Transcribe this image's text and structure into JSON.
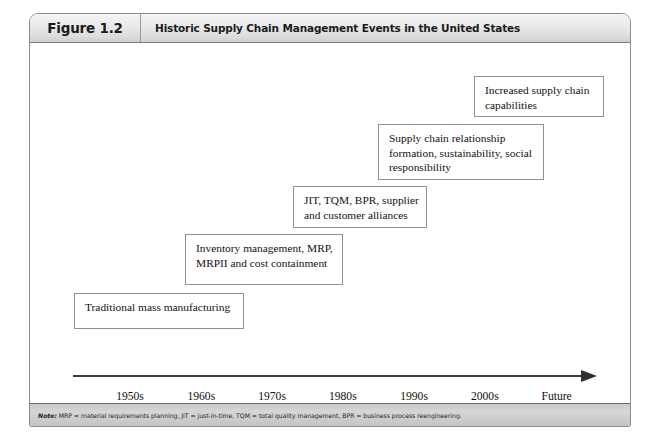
{
  "figure": {
    "number_label": "Figure 1.2",
    "title": "Historic Supply Chain Management Events in the United States",
    "note_prefix": "Note:",
    "note_text": " MRP = material requirements planning, JIT = just-in-time, TQM = total quality management, BPR = business process reengineering.",
    "border_color": "#8d8d8d",
    "header_bg": "#e4e4e4",
    "note_bg": "#c9c9c9"
  },
  "chart_data": {
    "type": "timeline",
    "title": "Historic Supply Chain Management Events in the United States",
    "xlabel": "",
    "ylabel": "",
    "axis_direction": "left-to-right arrow",
    "tick_labels": [
      "1950s",
      "1960s",
      "1970s",
      "1980s",
      "1990s",
      "2000s",
      "Future"
    ],
    "tick_positions_pct": [
      10.8,
      24.3,
      37.7,
      51.1,
      64.6,
      78.0,
      91.6
    ],
    "events": [
      {
        "era": "1950s",
        "lines": [
          "Traditional mass manufacturing"
        ],
        "box": {
          "left": 44,
          "top": 250,
          "width": 170,
          "height": 36
        }
      },
      {
        "era": "1970s",
        "lines": [
          "Inventory management, MRP,",
          "MRPII and cost containment"
        ],
        "box": {
          "left": 155,
          "top": 191,
          "width": 158,
          "height": 51
        }
      },
      {
        "era": "1980s",
        "lines": [
          "JIT, TQM, BPR, supplier",
          "and customer alliances"
        ],
        "box": {
          "left": 263,
          "top": 143,
          "width": 134,
          "height": 42
        }
      },
      {
        "era": "1990s",
        "lines": [
          "Supply chain relationship",
          "formation, sustainability, social",
          "responsibility"
        ],
        "box": {
          "left": 348,
          "top": 81,
          "width": 166,
          "height": 56
        }
      },
      {
        "era": "2000s",
        "lines": [
          "Increased supply chain",
          "capabilities"
        ],
        "box": {
          "left": 444,
          "top": 33,
          "width": 130,
          "height": 41
        }
      }
    ]
  }
}
